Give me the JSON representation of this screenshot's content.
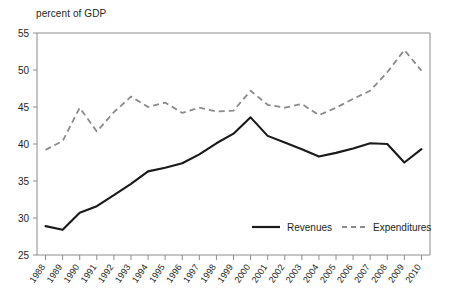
{
  "chart_data": {
    "type": "line",
    "title": "",
    "subtitle": "",
    "ylabel": "percent of GDP",
    "xlabel": "",
    "ylim": [
      25,
      55
    ],
    "ytick_values": [
      25,
      30,
      35,
      40,
      45,
      50,
      55
    ],
    "ytick_labels": [
      "25",
      "30",
      "35",
      "40",
      "45",
      "50",
      "55"
    ],
    "grid": false,
    "legend_position": "inside-bottom-right",
    "categories": [
      "1988",
      "1989",
      "1990",
      "1991",
      "1992",
      "1993",
      "1994",
      "1995",
      "1996",
      "1997",
      "1998",
      "1999",
      "2000",
      "2001",
      "2002",
      "2003",
      "2004",
      "2005",
      "2006",
      "2007",
      "2008",
      "2009",
      "2010"
    ],
    "series": [
      {
        "name": "Revenues",
        "style": "solid",
        "color": "#1a1a1a",
        "values": [
          28.9,
          28.4,
          30.7,
          31.6,
          33.1,
          34.6,
          36.3,
          36.8,
          37.4,
          38.6,
          40.1,
          41.4,
          43.6,
          41.1,
          40.2,
          39.3,
          38.3,
          38.8,
          39.4,
          40.1,
          40.0,
          37.5,
          39.3
        ]
      },
      {
        "name": "Expenditures",
        "style": "dashed",
        "color": "#8a8a8a",
        "values": [
          39.2,
          40.4,
          44.9,
          41.7,
          44.3,
          46.4,
          45.0,
          45.6,
          44.2,
          44.9,
          44.4,
          44.5,
          47.2,
          45.3,
          44.9,
          45.4,
          43.9,
          44.9,
          46.1,
          47.2,
          49.7,
          52.7,
          49.9
        ]
      }
    ],
    "legend": [
      {
        "label": "Revenues",
        "style": "solid",
        "color": "#1a1a1a"
      },
      {
        "label": "Expenditures",
        "style": "dashed",
        "color": "#8a8a8a"
      }
    ]
  },
  "colors": {
    "revenues": "#1a1a1a",
    "expenditures": "#8a8a8a",
    "frame": "#8c8c8c",
    "text": "#231f20",
    "background": "#ffffff"
  }
}
